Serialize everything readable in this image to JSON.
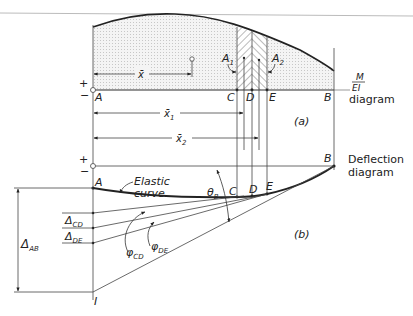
{
  "figure": {
    "part_a": {
      "caption": "(a)",
      "diagram_label_top": "M",
      "diagram_label_bottom": "EI",
      "diagram_label_word": "diagram",
      "sign_plus": "+",
      "sign_minus": "−",
      "points": {
        "A": "A",
        "C": "C",
        "D": "D",
        "E": "E",
        "B": "B"
      },
      "areas": {
        "A1": "A",
        "A1_sub": "1",
        "A2": "A",
        "A2_sub": "2"
      },
      "dimensions": {
        "xbar": "x̄",
        "xbar1": "x̄",
        "xbar1_sub": "1",
        "xbar2": "x̄",
        "xbar2_sub": "2"
      }
    },
    "part_b": {
      "caption": "(b)",
      "diagram_label_line1": "Deflection",
      "diagram_label_line2": "diagram",
      "sign_plus": "+",
      "sign_minus": "−",
      "elastic_curve_line1": "Elastic",
      "elastic_curve_line2": "curve",
      "points": {
        "A": "A",
        "C": "C",
        "D": "D",
        "E": "E",
        "B": "B",
        "I": "I"
      },
      "theta": "θ",
      "theta_sub": "B",
      "delta_cd": "Δ",
      "delta_cd_sub": "CD",
      "delta_de": "Δ",
      "delta_de_sub": "DE",
      "delta_ab": "Δ",
      "delta_ab_sub": "AB",
      "phi_cd": "φ",
      "phi_cd_sub": "CD",
      "phi_de": "φ",
      "phi_de_sub": "DE"
    }
  }
}
